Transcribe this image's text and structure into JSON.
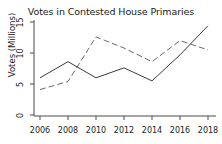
{
  "chart_data": {
    "type": "line",
    "title": "Votes in Contested House Primaries",
    "xlabel": "",
    "ylabel": "Votes (Millions)",
    "x": [
      2006,
      2008,
      2010,
      2012,
      2014,
      2016,
      2018
    ],
    "xtick_labels": [
      "2006",
      "2008",
      "2010",
      "2012",
      "2014",
      "2016",
      "2018"
    ],
    "ytick_labels": [
      "0",
      "5",
      "10",
      "15"
    ],
    "yticks": [
      0,
      5,
      10,
      15
    ],
    "xlim": [
      2005,
      2019
    ],
    "ylim": [
      0,
      15
    ],
    "grid": false,
    "legend": "none",
    "series": [
      {
        "name": "solid-series",
        "style": "solid",
        "color": "#3a3a3a",
        "values": [
          6.0,
          8.6,
          6.0,
          7.6,
          5.5,
          9.7,
          14.4
        ]
      },
      {
        "name": "dashed-series",
        "style": "dashed",
        "color": "#6a6a6a",
        "values": [
          4.1,
          5.4,
          12.6,
          10.8,
          8.6,
          12.0,
          10.5
        ]
      }
    ],
    "axis_color": "#4a4a4a"
  }
}
